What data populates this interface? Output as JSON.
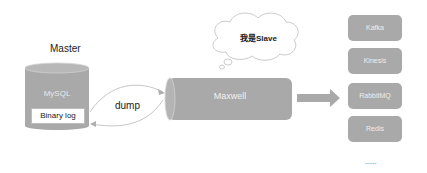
{
  "diagram": {
    "master": {
      "title": "Master",
      "database_label": "MySQL",
      "log_label": "Binary log"
    },
    "connection": {
      "label": "dump"
    },
    "slave": {
      "name": "Maxwell",
      "thought": "我是Slave"
    },
    "targets": [
      {
        "label": "Kafka"
      },
      {
        "label": "Kinesis"
      },
      {
        "label": "RabbitMQ"
      },
      {
        "label": "Redis"
      }
    ],
    "more": "......",
    "colors": {
      "shape_fill": "#a9a9a9",
      "shape_top": "#bdbdbd",
      "arrow": "#c8c8c8",
      "background": "#ffffff"
    }
  }
}
